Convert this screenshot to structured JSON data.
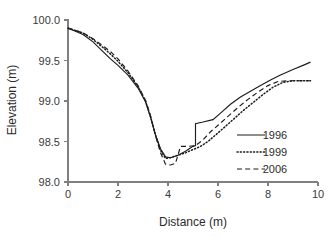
{
  "chart_data": {
    "type": "line",
    "title": "",
    "xlabel": "Distance (m)",
    "ylabel": "Elevation (m)",
    "xlim": [
      0,
      10
    ],
    "ylim": [
      98.0,
      100.0
    ],
    "xticks": [
      "0",
      "2",
      "4",
      "6",
      "8",
      "10"
    ],
    "xtick_values": [
      0,
      2,
      4,
      6,
      8,
      10
    ],
    "yticks": [
      "98.0",
      "98.5",
      "99.0",
      "99.5",
      "100.0"
    ],
    "ytick_values": [
      98.0,
      98.5,
      99.0,
      99.5,
      100.0
    ],
    "grid": false,
    "legend_position": "center-right",
    "series": [
      {
        "name": "1996",
        "style": "solid",
        "color": "#1c1c1c",
        "points": [
          [
            0.0,
            99.9
          ],
          [
            0.3,
            99.86
          ],
          [
            0.6,
            99.82
          ],
          [
            1.0,
            99.73
          ],
          [
            1.4,
            99.61
          ],
          [
            1.7,
            99.52
          ],
          [
            2.0,
            99.44
          ],
          [
            2.4,
            99.32
          ],
          [
            2.8,
            99.16
          ],
          [
            3.1,
            98.99
          ],
          [
            3.3,
            98.8
          ],
          [
            3.5,
            98.58
          ],
          [
            3.7,
            98.41
          ],
          [
            3.9,
            98.31
          ],
          [
            4.1,
            98.3
          ],
          [
            4.4,
            98.33
          ],
          [
            4.7,
            98.38
          ],
          [
            5.0,
            98.44
          ],
          [
            5.1,
            98.45
          ],
          [
            5.1,
            98.72
          ],
          [
            5.4,
            98.74
          ],
          [
            5.8,
            98.77
          ],
          [
            6.1,
            98.85
          ],
          [
            6.5,
            98.96
          ],
          [
            6.9,
            99.05
          ],
          [
            7.3,
            99.12
          ],
          [
            7.7,
            99.19
          ],
          [
            8.1,
            99.26
          ],
          [
            8.5,
            99.32
          ],
          [
            9.0,
            99.39
          ],
          [
            9.4,
            99.44
          ],
          [
            9.7,
            99.48
          ]
        ]
      },
      {
        "name": "1999",
        "style": "dotted",
        "color": "#1c1c1c",
        "points": [
          [
            0.0,
            99.9
          ],
          [
            0.3,
            99.87
          ],
          [
            0.6,
            99.84
          ],
          [
            1.0,
            99.76
          ],
          [
            1.4,
            99.66
          ],
          [
            1.7,
            99.58
          ],
          [
            2.0,
            99.49
          ],
          [
            2.4,
            99.35
          ],
          [
            2.8,
            99.18
          ],
          [
            3.1,
            99.0
          ],
          [
            3.3,
            98.81
          ],
          [
            3.5,
            98.58
          ],
          [
            3.7,
            98.39
          ],
          [
            3.9,
            98.29
          ],
          [
            4.1,
            98.3
          ],
          [
            4.4,
            98.33
          ],
          [
            4.7,
            98.36
          ],
          [
            5.0,
            98.4
          ],
          [
            5.3,
            98.44
          ],
          [
            5.6,
            98.5
          ],
          [
            5.9,
            98.58
          ],
          [
            6.2,
            98.66
          ],
          [
            6.6,
            98.77
          ],
          [
            7.0,
            98.88
          ],
          [
            7.4,
            98.98
          ],
          [
            7.8,
            99.08
          ],
          [
            8.2,
            99.17
          ],
          [
            8.6,
            99.23
          ],
          [
            9.0,
            99.25
          ],
          [
            9.4,
            99.25
          ],
          [
            9.7,
            99.25
          ]
        ]
      },
      {
        "name": "2006",
        "style": "dashed",
        "color": "#1c1c1c",
        "points": [
          [
            0.0,
            99.9
          ],
          [
            0.3,
            99.87
          ],
          [
            0.6,
            99.84
          ],
          [
            1.0,
            99.77
          ],
          [
            1.4,
            99.68
          ],
          [
            1.7,
            99.61
          ],
          [
            2.0,
            99.52
          ],
          [
            2.4,
            99.37
          ],
          [
            2.8,
            99.19
          ],
          [
            3.1,
            99.01
          ],
          [
            3.3,
            98.82
          ],
          [
            3.5,
            98.57
          ],
          [
            3.7,
            98.36
          ],
          [
            3.9,
            98.22
          ],
          [
            4.1,
            98.21
          ],
          [
            4.3,
            98.23
          ],
          [
            4.5,
            98.44
          ],
          [
            4.8,
            98.44
          ],
          [
            5.1,
            98.45
          ],
          [
            5.4,
            98.52
          ],
          [
            5.7,
            98.62
          ],
          [
            6.0,
            98.7
          ],
          [
            6.4,
            98.81
          ],
          [
            6.8,
            98.92
          ],
          [
            7.2,
            99.02
          ],
          [
            7.6,
            99.11
          ],
          [
            8.0,
            99.19
          ],
          [
            8.4,
            99.24
          ],
          [
            8.8,
            99.25
          ],
          [
            9.2,
            99.25
          ],
          [
            9.7,
            99.25
          ]
        ]
      }
    ],
    "legend_entries": [
      {
        "label": "1996",
        "style": "solid"
      },
      {
        "label": "1999",
        "style": "dotted"
      },
      {
        "label": "2006",
        "style": "dashed"
      }
    ]
  }
}
